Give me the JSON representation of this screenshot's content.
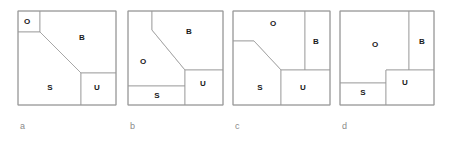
{
  "figure": {
    "background_color": "#ffffff",
    "line_color": "#9a9a9a",
    "label_color": "#8a8a8a",
    "region_text_color": "#1a1a1a",
    "panels": [
      {
        "id": "panel-a",
        "caption": "a",
        "caption_x": 20,
        "caption_y": 129,
        "frame": {
          "x": 18,
          "y": 11,
          "width": 98,
          "height": 94
        },
        "regions": [
          {
            "key": "O",
            "label": "O",
            "label_x": 27,
            "label_y": 22
          },
          {
            "key": "B",
            "label": "B",
            "label_x": 82,
            "label_y": 38
          },
          {
            "key": "S",
            "label": "S",
            "label_x": 50,
            "label_y": 88
          },
          {
            "key": "U",
            "label": "U",
            "label_x": 97,
            "label_y": 88
          }
        ],
        "paths": {
          "O": "M 18 11 L 40 11 L 40 32 L 18 32 Z",
          "B": "M 40 11 L 116 11 L 116 73 L 81 73 L 40 32 Z",
          "S": "M 18 32 L 40 32 L 81 73 L 81 105 L 18 105 Z",
          "U": "M 81 73 L 116 73 L 116 105 L 81 105 Z"
        }
      },
      {
        "id": "panel-b",
        "caption": "b",
        "caption_x": 130,
        "caption_y": 129,
        "frame": {
          "x": 128,
          "y": 11,
          "width": 95,
          "height": 94
        },
        "regions": [
          {
            "key": "B",
            "label": "B",
            "label_x": 189,
            "label_y": 32
          },
          {
            "key": "O",
            "label": "O",
            "label_x": 143,
            "label_y": 62
          },
          {
            "key": "S",
            "label": "S",
            "label_x": 157,
            "label_y": 96
          },
          {
            "key": "U",
            "label": "U",
            "label_x": 203,
            "label_y": 84
          }
        ],
        "paths": {
          "O": "M 128 11 L 152 11 L 152 30 L 185 70 L 185 86 L 128 86 Z",
          "B": "M 152 11 L 223 11 L 223 70 L 185 70 L 152 30 Z",
          "S": "M 128 86 L 185 86 L 185 105 L 128 105 Z",
          "U": "M 185 70 L 223 70 L 223 105 L 185 105 Z"
        }
      },
      {
        "id": "panel-c",
        "caption": "c",
        "caption_x": 235,
        "caption_y": 129,
        "frame": {
          "x": 233,
          "y": 11,
          "width": 97,
          "height": 94
        },
        "regions": [
          {
            "key": "O",
            "label": "O",
            "label_x": 273,
            "label_y": 24
          },
          {
            "key": "B",
            "label": "B",
            "label_x": 316,
            "label_y": 42
          },
          {
            "key": "S",
            "label": "S",
            "label_x": 260,
            "label_y": 88
          },
          {
            "key": "U",
            "label": "U",
            "label_x": 303,
            "label_y": 88
          }
        ],
        "paths": {
          "O": "M 233 11 L 305 11 L 305 70 L 281 70 L 254 41 L 233 41 Z",
          "B": "M 305 11 L 330 11 L 330 70 L 305 70 Z",
          "S": "M 233 41 L 254 41 L 281 70 L 281 105 L 233 105 Z",
          "U": "M 281 70 L 330 70 L 330 105 L 281 105 Z"
        }
      },
      {
        "id": "panel-d",
        "caption": "d",
        "caption_x": 342,
        "caption_y": 129,
        "frame": {
          "x": 340,
          "y": 11,
          "width": 94,
          "height": 94
        },
        "regions": [
          {
            "key": "O",
            "label": "O",
            "label_x": 375,
            "label_y": 45
          },
          {
            "key": "B",
            "label": "B",
            "label_x": 422,
            "label_y": 42
          },
          {
            "key": "S",
            "label": "S",
            "label_x": 363,
            "label_y": 93
          },
          {
            "key": "U",
            "label": "U",
            "label_x": 405,
            "label_y": 83
          }
        ],
        "paths": {
          "O": "M 340 11 L 409 11 L 409 70 L 386 70 L 386 83 L 340 83 Z",
          "B": "M 409 11 L 434 11 L 434 70 L 409 70 Z",
          "S": "M 340 83 L 386 83 L 386 105 L 340 105 Z",
          "U": "M 386 70 L 434 70 L 434 105 L 386 105 Z"
        }
      }
    ]
  }
}
